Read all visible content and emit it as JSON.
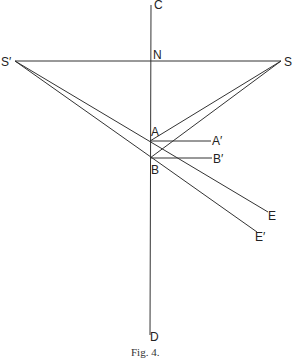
{
  "figure": {
    "caption": "Fig. 4.",
    "labels": {
      "C": "C",
      "N": "N",
      "S_prime": "S′",
      "S": "S",
      "A": "A",
      "A_prime": "A′",
      "B": "B",
      "B_prime": "B′",
      "E": "E",
      "E_prime": "E′",
      "D": "D"
    },
    "points": {
      "C": [
        151,
        5
      ],
      "D": [
        150,
        335
      ],
      "N": [
        151,
        61
      ],
      "S_prime": [
        15,
        61
      ],
      "S": [
        281,
        61
      ],
      "A": [
        150,
        141
      ],
      "A_prime": [
        211,
        141
      ],
      "B": [
        150,
        158
      ],
      "B_prime": [
        212,
        158
      ],
      "E": [
        268,
        212
      ],
      "E_prime": [
        257,
        232
      ]
    },
    "colors": {
      "stroke": "#333333",
      "background": "#ffffff"
    }
  }
}
